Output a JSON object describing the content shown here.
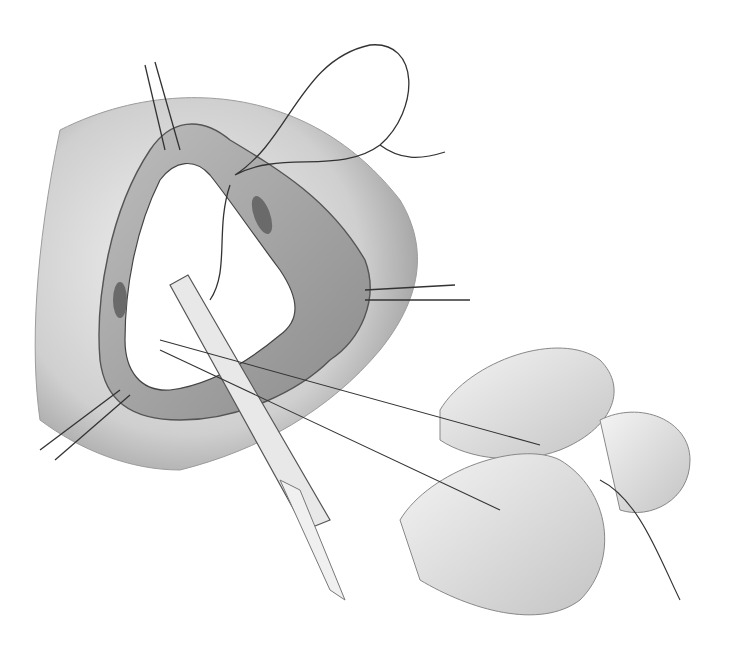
{
  "illustration": {
    "type": "surgical-illustration",
    "style": "grayscale pencil rendering",
    "elements": [
      "tissue-opening",
      "suture-loop",
      "forceps",
      "gloved-fingers",
      "suture-threads"
    ],
    "colors": {
      "background": "#ffffff",
      "tissue_light": "#d8d8d8",
      "tissue_mid": "#a8a8a8",
      "tissue_dark": "#6a6a6a",
      "line": "#2a2a2a",
      "glove": "#e6e6e6"
    }
  }
}
